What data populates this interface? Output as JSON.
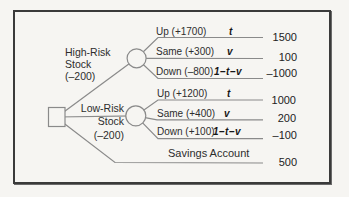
{
  "colors": {
    "background": "#f6f5f2",
    "frame_border": "#3a3a3a",
    "branch_line": "#8a8a8a",
    "text": "#2d2d2d"
  },
  "tree": {
    "root_node": "decision-square",
    "chance_nodes": [
      "high-risk-circle",
      "low-risk-circle"
    ],
    "branches": {
      "high_risk": {
        "label": [
          "High-Risk",
          "Stock",
          "(–200)"
        ],
        "outcomes": [
          {
            "label": "Up (+1700)",
            "prob": "t",
            "payoff": "1500"
          },
          {
            "label": "Same (+300)",
            "prob": "v",
            "payoff": "100"
          },
          {
            "label": "Down (–800)",
            "prob": "1–t–v",
            "payoff": "–1000"
          }
        ]
      },
      "low_risk": {
        "label": [
          "Low-Risk",
          "Stock",
          "(–200)"
        ],
        "outcomes": [
          {
            "label": "Up (+1200)",
            "prob": "t",
            "payoff": "1000"
          },
          {
            "label": "Same (+400)",
            "prob": "v",
            "payoff": "200"
          },
          {
            "label": "Down (+100)",
            "prob": "1–t–v",
            "payoff": "–100"
          }
        ]
      },
      "savings": {
        "label": "Savings Account",
        "payoff": "500"
      }
    }
  }
}
